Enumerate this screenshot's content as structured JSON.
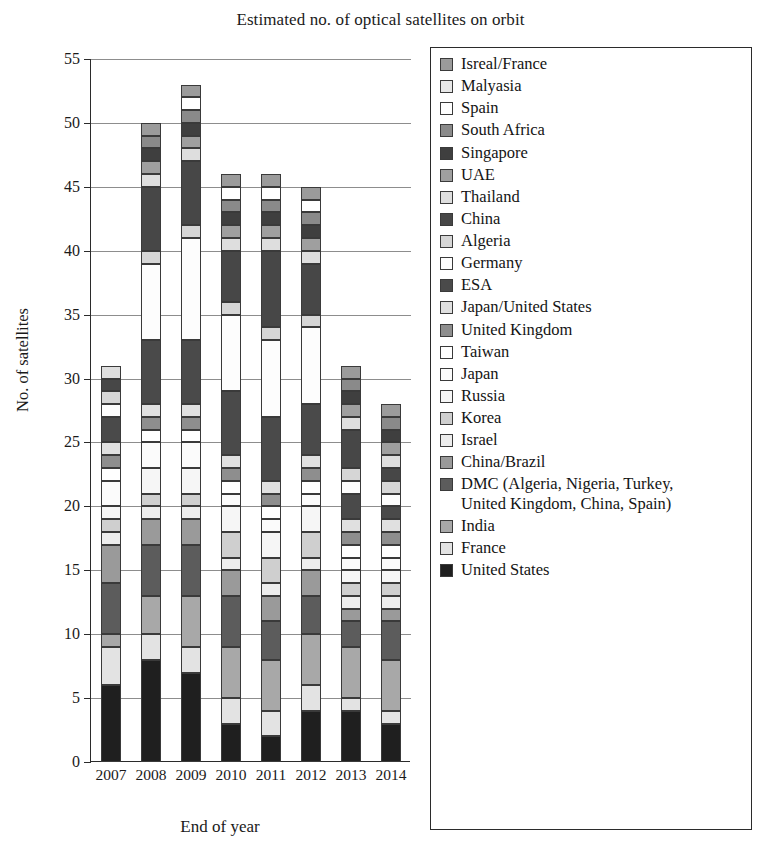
{
  "chart_data": {
    "type": "bar",
    "subtype": "stacked-bar",
    "title": "Estimated no. of optical satellites on orbit",
    "xlabel": "End of year",
    "ylabel": "No. of satellites",
    "categories": [
      "2007",
      "2008",
      "2009",
      "2010",
      "2011",
      "2012",
      "2013",
      "2014"
    ],
    "ylim": [
      0,
      55
    ],
    "yticks": [
      0,
      5,
      10,
      15,
      20,
      25,
      30,
      35,
      40,
      45,
      50,
      55
    ],
    "grid": true,
    "legend_position": "right",
    "totals": [
      31,
      49,
      51,
      44,
      45,
      42,
      29,
      24
    ],
    "series": [
      {
        "name": "United States",
        "color": "#1f1f1f",
        "values": [
          6,
          8,
          7,
          3,
          2,
          4,
          4,
          3
        ]
      },
      {
        "name": "France",
        "color": "#e3e3e3",
        "values": [
          3,
          2,
          2,
          2,
          2,
          2,
          1,
          1
        ]
      },
      {
        "name": "India",
        "color": "#a8a8a8",
        "values": [
          1,
          3,
          4,
          4,
          4,
          4,
          4,
          4
        ]
      },
      {
        "name": "DMC (Algeria, Nigeria, Turkey,\nUnited Kingdom, China, Spain)",
        "color": "#5c5c5c",
        "values": [
          4,
          4,
          4,
          4,
          3,
          3,
          2,
          3
        ]
      },
      {
        "name": "China/Brazil",
        "color": "#9a9a9a",
        "values": [
          3,
          2,
          2,
          2,
          2,
          2,
          1,
          1
        ]
      },
      {
        "name": "Israel",
        "color": "#ededed",
        "values": [
          1,
          1,
          1,
          1,
          1,
          1,
          1,
          1
        ]
      },
      {
        "name": "Korea",
        "color": "#cfcfcf",
        "values": [
          1,
          1,
          1,
          2,
          2,
          2,
          1,
          1
        ]
      },
      {
        "name": "Russia",
        "color": "#f6f6f6",
        "values": [
          1,
          2,
          2,
          2,
          2,
          2,
          1,
          1
        ]
      },
      {
        "name": "Japan",
        "color": "#fbfbfb",
        "values": [
          2,
          2,
          2,
          1,
          1,
          1,
          1,
          1
        ]
      },
      {
        "name": "Taiwan",
        "color": "#ffffff",
        "values": [
          1,
          1,
          1,
          1,
          1,
          1,
          1,
          1
        ]
      },
      {
        "name": "United Kingdom",
        "color": "#8e8e8e",
        "values": [
          1,
          1,
          1,
          1,
          1,
          1,
          1,
          1
        ]
      },
      {
        "name": "Japan/United States",
        "color": "#e0e0e0",
        "values": [
          1,
          1,
          1,
          1,
          1,
          1,
          1,
          1
        ]
      },
      {
        "name": "ESA",
        "color": "#4a4a4a",
        "values": [
          2,
          5,
          5,
          5,
          5,
          4,
          2,
          1
        ]
      },
      {
        "name": "Germany",
        "color": "#fdfdfd",
        "values": [
          1,
          6,
          8,
          6,
          6,
          6,
          1,
          1
        ]
      },
      {
        "name": "Algeria",
        "color": "#d6d6d6",
        "values": [
          1,
          1,
          1,
          1,
          1,
          1,
          1,
          1
        ]
      },
      {
        "name": "China",
        "color": "#474747",
        "values": [
          1,
          5,
          5,
          4,
          6,
          4,
          3,
          1
        ]
      },
      {
        "name": "Thailand",
        "color": "#dedede",
        "values": [
          1,
          1,
          1,
          1,
          1,
          1,
          1,
          1
        ]
      },
      {
        "name": "UAE",
        "color": "#9f9f9f",
        "values": [
          0,
          1,
          1,
          1,
          1,
          1,
          1,
          1
        ]
      },
      {
        "name": "Singapore",
        "color": "#3f3f3f",
        "values": [
          0,
          1,
          1,
          1,
          1,
          1,
          1,
          1
        ]
      },
      {
        "name": "South Africa",
        "color": "#8a8a8a",
        "values": [
          0,
          1,
          1,
          1,
          1,
          1,
          1,
          1
        ]
      },
      {
        "name": "Spain",
        "color": "#ffffff",
        "values": [
          0,
          0,
          1,
          1,
          1,
          1,
          0,
          0
        ]
      },
      {
        "name": "Isreal/France",
        "color": "#9b9b9b",
        "values": [
          0,
          1,
          1,
          1,
          1,
          1,
          1,
          1
        ]
      }
    ]
  },
  "legend": {
    "items": [
      {
        "label": "Isreal/France",
        "color": "#9b9b9b"
      },
      {
        "label": "Malyasia",
        "color": "#e8e8e8"
      },
      {
        "label": "Spain",
        "color": "#ffffff"
      },
      {
        "label": "South Africa",
        "color": "#8a8a8a"
      },
      {
        "label": "Singapore",
        "color": "#3f3f3f"
      },
      {
        "label": "UAE",
        "color": "#9f9f9f"
      },
      {
        "label": "Thailand",
        "color": "#dedede"
      },
      {
        "label": "China",
        "color": "#474747"
      },
      {
        "label": "Algeria",
        "color": "#d6d6d6"
      },
      {
        "label": "Germany",
        "color": "#fdfdfd"
      },
      {
        "label": "ESA",
        "color": "#4a4a4a"
      },
      {
        "label": "Japan/United States",
        "color": "#e0e0e0"
      },
      {
        "label": "United Kingdom",
        "color": "#8e8e8e"
      },
      {
        "label": "Taiwan",
        "color": "#ffffff"
      },
      {
        "label": "Japan",
        "color": "#fbfbfb"
      },
      {
        "label": "Russia",
        "color": "#f6f6f6"
      },
      {
        "label": "Korea",
        "color": "#cfcfcf"
      },
      {
        "label": "Israel",
        "color": "#ededed"
      },
      {
        "label": "China/Brazil",
        "color": "#9a9a9a"
      },
      {
        "label": "DMC (Algeria, Nigeria, Turkey,\nUnited Kingdom, China, Spain)",
        "color": "#5c5c5c"
      },
      {
        "label": "India",
        "color": "#a8a8a8"
      },
      {
        "label": "France",
        "color": "#e3e3e3"
      },
      {
        "label": "United States",
        "color": "#1f1f1f"
      }
    ]
  }
}
